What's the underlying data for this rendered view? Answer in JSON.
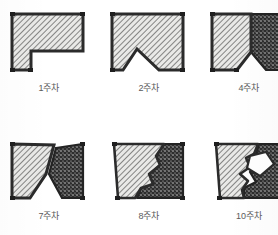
{
  "figure": {
    "caption_note": "",
    "colors": {
      "outline": "#2b2b2b",
      "hatch_fill": "#e8e8e6",
      "hatch_line": "#4a4a4a",
      "stipple_fill": "#2e2e2e",
      "stipple_dot": "#d8d8d8",
      "void_fill": "#ffffff",
      "label_text": "#5a5a5a",
      "background": "#ffffff"
    },
    "legend_textures": [
      {
        "name": "hatched-region",
        "label": ""
      },
      {
        "name": "stippled-region",
        "label": ""
      },
      {
        "name": "void-region",
        "label": ""
      }
    ],
    "panels": [
      {
        "id": "panel-week-1",
        "label": "1주차",
        "row": 0,
        "col": 0,
        "regions": [
          "hatched-region"
        ],
        "stage_number": "1"
      },
      {
        "id": "panel-week-2",
        "label": "2주차",
        "row": 0,
        "col": 1,
        "regions": [
          "hatched-region"
        ],
        "stage_number": "2"
      },
      {
        "id": "panel-week-4",
        "label": "4주차",
        "row": 0,
        "col": 2,
        "regions": [
          "hatched-region",
          "stippled-region"
        ],
        "stage_number": "4"
      },
      {
        "id": "panel-week-7",
        "label": "7주차",
        "row": 1,
        "col": 0,
        "regions": [
          "hatched-region",
          "stippled-region"
        ],
        "stage_number": "7"
      },
      {
        "id": "panel-week-8",
        "label": "8주차",
        "row": 1,
        "col": 1,
        "regions": [
          "hatched-region",
          "stippled-region"
        ],
        "stage_number": "8"
      },
      {
        "id": "panel-week-10",
        "label": "10주차",
        "row": 1,
        "col": 2,
        "regions": [
          "hatched-region",
          "stippled-region",
          "void-region"
        ],
        "stage_number": "10"
      }
    ]
  }
}
